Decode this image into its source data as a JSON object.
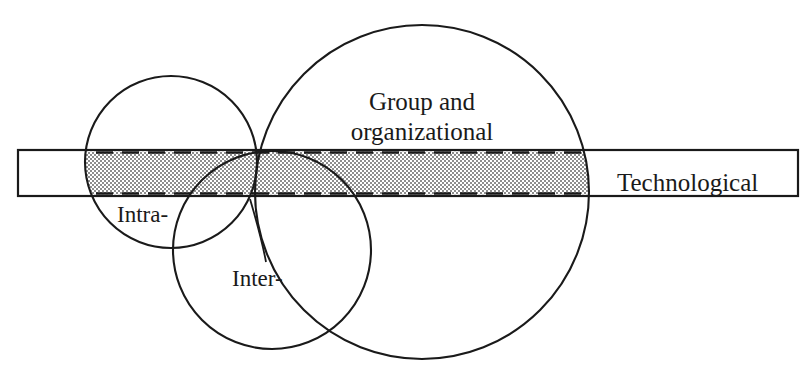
{
  "figure": {
    "background_color": "#ffffff",
    "line_color": "#1a1a1a",
    "shading_color": "#8a8a8a",
    "width": 810,
    "height": 374
  },
  "labels": {
    "group_line1": "Group and",
    "group_line2": "organizational",
    "technological": "Technological",
    "intra": "Intra-",
    "inter": "Inter-"
  },
  "shapes": {
    "circle_intra": {
      "name": "Intra-",
      "cx": 171,
      "cy": 162,
      "r": 86
    },
    "circle_inter": {
      "name": "Inter-",
      "cx": 272,
      "cy": 250,
      "r": 99
    },
    "circle_group": {
      "name": "Group and organizational",
      "cx": 422,
      "cy": 192,
      "r": 167
    },
    "bar_technological": {
      "name": "Technological",
      "x": 18,
      "y": 150,
      "width": 780,
      "height": 46
    },
    "shaded_band": {
      "description": "Stippled overlap of the Technological bar with the circles",
      "x_start": 96,
      "x_end": 589,
      "y_top": 153,
      "y_bottom": 193,
      "edge_style": "dashed"
    },
    "leader_line_inter": {
      "description": "Curved leader connecting the Inter- label to the Inter- circle boundary",
      "from_x": 265,
      "from_y": 258,
      "to_x": 250,
      "to_y": 200
    }
  }
}
